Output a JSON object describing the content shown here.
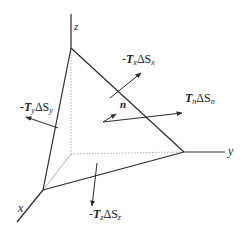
{
  "diagram": {
    "axes": {
      "x": "x",
      "y": "y",
      "z": "z"
    },
    "labels": {
      "Tx": {
        "sign": "-",
        "T": "T",
        "sub": "x",
        "dS": "ΔS",
        "dsub": "x"
      },
      "Ty": {
        "sign": "-",
        "T": "T",
        "sub": "y",
        "dS": "ΔS",
        "dsub": "y"
      },
      "Tz": {
        "sign": "-",
        "T": "T",
        "sub": "z",
        "dS": "ΔS",
        "dsub": "z"
      },
      "Tn": {
        "sign": "",
        "T": "T",
        "sub": "n",
        "dS": "ΔS",
        "dsub": "n"
      },
      "normal": "n"
    },
    "colors": {
      "line": "#2a2a2a",
      "hidden": "#9a9a9a"
    }
  }
}
